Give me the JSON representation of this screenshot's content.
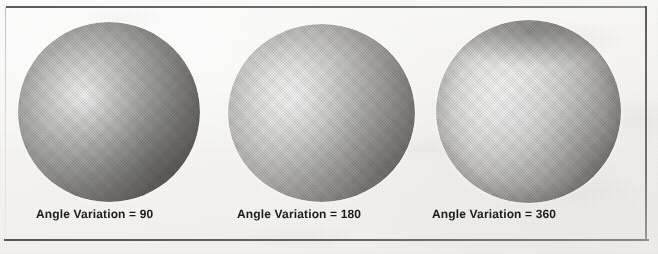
{
  "figure": {
    "kind": "scanned-figure",
    "background_color": "#f7f6f3",
    "frame_color": "#6f6f70",
    "caption_color": "#1c1c1e",
    "panels": [
      {
        "id": "panel-1",
        "caption": "Angle Variation = 90",
        "parameter_name": "Angle Variation",
        "parameter_value": "90",
        "sphere": {
          "name": "shaded-sphere-90",
          "highlight_position": "upper-left",
          "highlight_size": "tight",
          "highlight_color": "#fdfdfd",
          "shadow_color": "#4a4944",
          "rim_darkness": "moderate"
        }
      },
      {
        "id": "panel-2",
        "caption": "Angle Variation = 180",
        "parameter_name": "Angle Variation",
        "parameter_value": "180",
        "sphere": {
          "name": "shaded-sphere-180",
          "highlight_position": "upper-left",
          "highlight_size": "broad",
          "highlight_color": "#fbfbfb",
          "shadow_color": "#5c5a54",
          "rim_darkness": "moderate"
        }
      },
      {
        "id": "panel-3",
        "caption": "Angle Variation = 360",
        "parameter_name": "Angle Variation",
        "parameter_value": "360",
        "sphere": {
          "name": "shaded-sphere-360",
          "highlight_position": "center",
          "highlight_size": "very-broad",
          "highlight_color": "#fbfbfa",
          "shadow_color": "#5a5952",
          "rim_darkness": "strong"
        }
      }
    ]
  }
}
